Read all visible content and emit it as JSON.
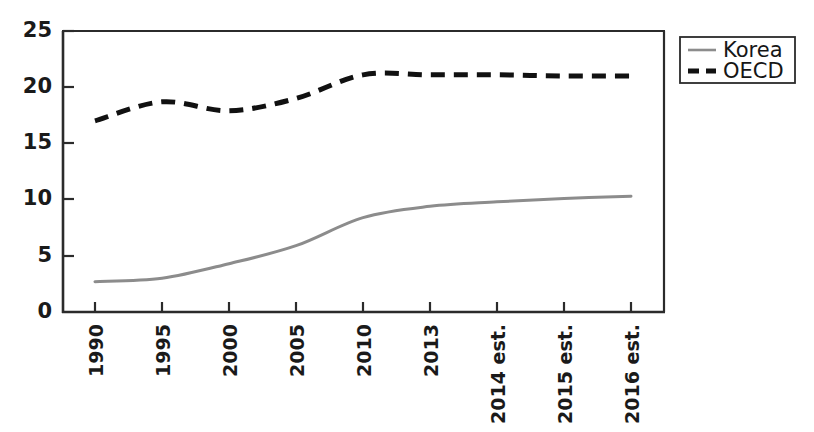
{
  "chart_data": {
    "type": "line",
    "title": "",
    "subtitle": "",
    "xlabel": "",
    "ylabel": "",
    "categories": [
      "1990",
      "1995",
      "2000",
      "2005",
      "2010",
      "2013",
      "2014 est.",
      "2015 est.",
      "2016 est."
    ],
    "ytick_labels": [
      "0",
      "5",
      "10",
      "15",
      "20",
      "25"
    ],
    "ytick_values": [
      0,
      5,
      10,
      15,
      20,
      25
    ],
    "ylim": [
      0,
      25
    ],
    "grid": false,
    "legend_position": "outside-top-right",
    "series": [
      {
        "name": "Korea",
        "color": "#8c8c8c",
        "style": "solid",
        "width": 3,
        "values": [
          2.7,
          3.0,
          4.3,
          5.9,
          8.4,
          9.4,
          9.8,
          10.1,
          10.3
        ]
      },
      {
        "name": "OECD",
        "color": "#111111",
        "style": "dashed",
        "width": 5,
        "values": [
          17.0,
          18.7,
          17.9,
          19.0,
          21.1,
          21.1,
          21.1,
          21.0,
          21.0
        ]
      }
    ]
  },
  "legend": {
    "entries": [
      {
        "label": "Korea",
        "swatch": "solid-line-swatch"
      },
      {
        "label": "OECD",
        "swatch": "dashed-line-swatch"
      }
    ]
  },
  "axes": {
    "axis_color": "#2b2b2b",
    "frame": "left-bottom-top-right"
  }
}
